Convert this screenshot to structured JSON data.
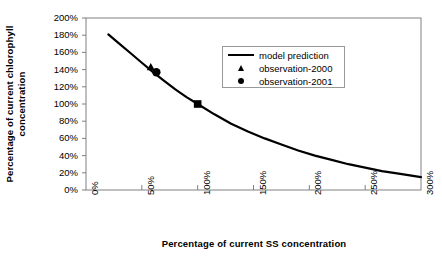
{
  "chart_data": {
    "type": "line",
    "title": "",
    "xlabel": "Percentage  of current  SS concentration",
    "ylabel_line1": "Percentage of current chlorophyll",
    "ylabel_line2": "concentration",
    "xlim": [
      0,
      300
    ],
    "ylim": [
      0,
      200
    ],
    "xtick_labels": [
      "0%",
      "50%",
      "100%",
      "150%",
      "200%",
      "250%",
      "300%"
    ],
    "xtick_values": [
      0,
      50,
      100,
      150,
      200,
      250,
      300
    ],
    "ytick_labels": [
      "0%",
      "20%",
      "40%",
      "60%",
      "80%",
      "100%",
      "120%",
      "140%",
      "160%",
      "180%",
      "200%"
    ],
    "ytick_values": [
      0,
      20,
      40,
      60,
      80,
      100,
      120,
      140,
      160,
      180,
      200
    ],
    "grid": false,
    "legend_position": "upper-center-right",
    "series": [
      {
        "name": "model prediction",
        "marker": "line",
        "color": "#000000",
        "x": [
          20,
          30,
          40,
          50,
          60,
          70,
          80,
          90,
          100,
          115,
          130,
          145,
          160,
          175,
          190,
          205,
          220,
          235,
          250,
          265,
          280,
          300
        ],
        "y": [
          181,
          170,
          159,
          148,
          137,
          127,
          117,
          108,
          100,
          88,
          77,
          68,
          60,
          53,
          46,
          40,
          35,
          30,
          26,
          22,
          19,
          15
        ]
      },
      {
        "name": "observation-2000",
        "marker": "triangle",
        "color": "#000000",
        "x": [
          58
        ],
        "y": [
          143
        ]
      },
      {
        "name": "observation-2001",
        "marker": "circle",
        "color": "#000000",
        "x": [
          63
        ],
        "y": [
          137
        ]
      },
      {
        "name": "observation-baseline",
        "marker": "square",
        "color": "#000000",
        "x": [
          100
        ],
        "y": [
          100
        ]
      }
    ],
    "legend_entries": [
      {
        "label": "model prediction",
        "symbol": "line"
      },
      {
        "label": "observation-2000",
        "symbol": "triangle"
      },
      {
        "label": "observation-2001",
        "symbol": "circle"
      }
    ],
    "axis_color": "#808080",
    "line_color": "#000000"
  }
}
